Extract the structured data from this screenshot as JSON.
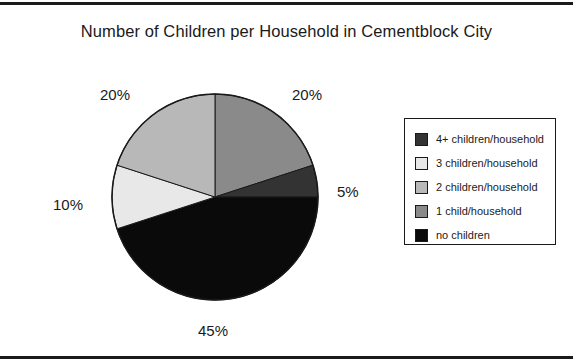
{
  "chart_title": "Number of Children per Household in Cementblock City",
  "frame": {
    "top_rule": "horizontal-rule",
    "bottom_rule": "horizontal-rule"
  },
  "chart_data": {
    "type": "pie",
    "title": "Number of Children per Household in Cementblock City",
    "xlabel": "",
    "ylabel": "",
    "legend_position": "right",
    "grid": false,
    "start_angle_deg": 0,
    "direction": "clockwise",
    "categories": [
      "4+ children/household",
      "3 children/household",
      "2 children/household",
      "1 child/household",
      "no children"
    ],
    "values": [
      5,
      10,
      20,
      20,
      45
    ],
    "colors": [
      "#333333",
      "#e8e8e8",
      "#b8b8b8",
      "#8a8a8a",
      "#0a0a0a"
    ],
    "slices": [
      {
        "label": "1 child/household",
        "value": 20,
        "display": "20%",
        "color": "#8a8a8a",
        "start_deg": 0,
        "end_deg": 72
      },
      {
        "label": "4+ children/household",
        "value": 5,
        "display": "5%",
        "color": "#333333",
        "start_deg": 72,
        "end_deg": 90
      },
      {
        "label": "no children",
        "value": 45,
        "display": "45%",
        "color": "#0a0a0a",
        "start_deg": 90,
        "end_deg": 252
      },
      {
        "label": "3 children/household",
        "value": 10,
        "display": "10%",
        "color": "#e8e8e8",
        "start_deg": 252,
        "end_deg": 288
      },
      {
        "label": "2 children/household",
        "value": 20,
        "display": "20%",
        "color": "#b8b8b8",
        "start_deg": 288,
        "end_deg": 360
      }
    ],
    "data_labels": [
      {
        "text": "20%",
        "x": 100,
        "y": 86,
        "slice": "2 children/household"
      },
      {
        "text": "20%",
        "x": 292,
        "y": 86,
        "slice": "1 child/household"
      },
      {
        "text": "5%",
        "x": 337,
        "y": 183,
        "slice": "4+ children/household"
      },
      {
        "text": "10%",
        "x": 53,
        "y": 196,
        "slice": "3 children/household"
      },
      {
        "text": "45%",
        "x": 198,
        "y": 322,
        "slice": "no children"
      }
    ]
  },
  "legend": {
    "items": [
      {
        "label": "4+ children/household",
        "color": "#333333"
      },
      {
        "label": "3 children/household",
        "color": "#e8e8e8"
      },
      {
        "label": "2 children/household",
        "color": "#b8b8b8"
      },
      {
        "label": "1 child/household",
        "color": "#8a8a8a"
      },
      {
        "label": "no children",
        "color": "#0a0a0a"
      }
    ]
  }
}
